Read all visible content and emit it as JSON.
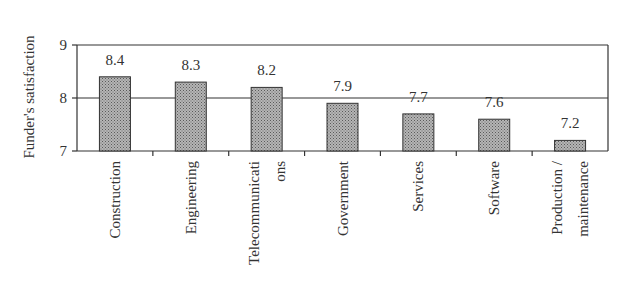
{
  "chart_data": {
    "type": "bar",
    "title": "",
    "xlabel": "",
    "ylabel": "Funder's satisfaction",
    "categories": [
      "Construction",
      "Engineering",
      "Telecommunications",
      "Government",
      "Services",
      "Software",
      "Production / maintenance"
    ],
    "category_label_lines": [
      [
        "Construction"
      ],
      [
        "Engineering"
      ],
      [
        "Telecommunicati",
        "ons"
      ],
      [
        "Government"
      ],
      [
        "Services"
      ],
      [
        "Software"
      ],
      [
        "Production /",
        "maintenance"
      ]
    ],
    "values": [
      8.4,
      8.3,
      8.2,
      7.9,
      7.7,
      7.6,
      7.2
    ],
    "data_labels": [
      "8.4",
      "8.3",
      "8.2",
      "7.9",
      "7.7",
      "7.6",
      "7.2"
    ],
    "ylim": [
      7,
      9
    ],
    "yticks": [
      7,
      8,
      9
    ],
    "grid": true,
    "legend": null,
    "bar_fill": "#a8a8a8",
    "bar_pattern": "dotted-hatch"
  }
}
